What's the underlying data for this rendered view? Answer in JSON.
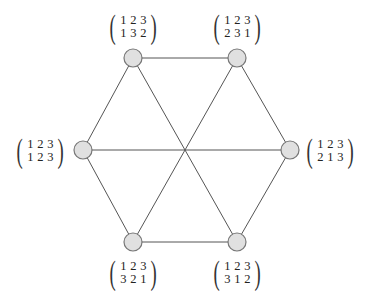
{
  "diagram": {
    "type": "graph",
    "colors": {
      "edge": "#555555",
      "node_fill": "#e0e0e0",
      "node_stroke": "#777777"
    },
    "nodes": [
      {
        "id": "n0",
        "x": 133,
        "y": 58,
        "top": [
          "1",
          "2",
          "3"
        ],
        "bottom": [
          "1",
          "3",
          "2"
        ],
        "label_x": 107,
        "label_y": 12
      },
      {
        "id": "n1",
        "x": 237,
        "y": 58,
        "top": [
          "1",
          "2",
          "3"
        ],
        "bottom": [
          "2",
          "3",
          "1"
        ],
        "label_x": 211,
        "label_y": 12
      },
      {
        "id": "n2",
        "x": 83,
        "y": 150,
        "top": [
          "1",
          "2",
          "3"
        ],
        "bottom": [
          "1",
          "2",
          "3"
        ],
        "label_x": 14,
        "label_y": 136
      },
      {
        "id": "n3",
        "x": 290,
        "y": 150,
        "top": [
          "1",
          "2",
          "3"
        ],
        "bottom": [
          "2",
          "1",
          "3"
        ],
        "label_x": 304,
        "label_y": 136
      },
      {
        "id": "n4",
        "x": 133,
        "y": 242,
        "top": [
          "1",
          "2",
          "3"
        ],
        "bottom": [
          "3",
          "2",
          "1"
        ],
        "label_x": 107,
        "label_y": 258
      },
      {
        "id": "n5",
        "x": 237,
        "y": 242,
        "top": [
          "1",
          "2",
          "3"
        ],
        "bottom": [
          "3",
          "1",
          "2"
        ],
        "label_x": 211,
        "label_y": 258
      }
    ],
    "edges": [
      [
        "n0",
        "n1"
      ],
      [
        "n1",
        "n3"
      ],
      [
        "n3",
        "n5"
      ],
      [
        "n5",
        "n4"
      ],
      [
        "n4",
        "n2"
      ],
      [
        "n2",
        "n0"
      ],
      [
        "n0",
        "n5"
      ],
      [
        "n1",
        "n4"
      ],
      [
        "n2",
        "n3"
      ]
    ]
  }
}
